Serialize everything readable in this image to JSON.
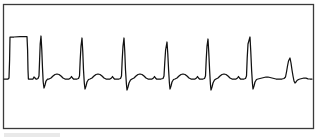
{
  "figure": {
    "kind": "ecg-rhythm-strip",
    "title": "",
    "caption": "",
    "background_color": "#ffffff",
    "frame": {
      "x": 3.5,
      "y": 4.5,
      "width": 310,
      "height": 124,
      "stroke_color": "#3a3a3a",
      "stroke_width": 1.3
    },
    "trace": {
      "stroke_color": "#111111",
      "stroke_width": 1.25
    },
    "artifact": {
      "x": 4,
      "y": 133,
      "width": 56,
      "height": 4,
      "color": "#e9e9e9"
    }
  },
  "chart_data": {
    "type": "line",
    "title": "",
    "xlabel": "",
    "ylabel": "",
    "grid": false,
    "legend": null,
    "xlim": [
      0,
      319
    ],
    "ylim": [
      128,
      4
    ],
    "baseline_y": 79,
    "annotations": [
      {
        "name": "calibration-pulse",
        "label": "calibration pulse",
        "x_start": 10,
        "x_end": 28,
        "top_y": 37,
        "baseline_y": 79
      }
    ],
    "beats": [
      {
        "index": 1,
        "r_peak_x": 41,
        "r_peak_y": 36,
        "s_trough_y": 88,
        "amplitude": "full"
      },
      {
        "index": 2,
        "r_peak_x": 82,
        "r_peak_y": 38,
        "s_trough_y": 89,
        "amplitude": "full"
      },
      {
        "index": 3,
        "r_peak_x": 124,
        "r_peak_y": 38,
        "s_trough_y": 90,
        "amplitude": "full"
      },
      {
        "index": 4,
        "r_peak_x": 167,
        "r_peak_y": 42,
        "s_trough_y": 89,
        "amplitude": "full"
      },
      {
        "index": 5,
        "r_peak_x": 208,
        "r_peak_y": 39,
        "s_trough_y": 90,
        "amplitude": "full"
      },
      {
        "index": 6,
        "r_peak_x": 250,
        "r_peak_y": 37,
        "s_trough_y": 89,
        "amplitude": "full"
      },
      {
        "index": 7,
        "r_peak_x": 290,
        "r_peak_y": 58,
        "s_trough_y": 83,
        "amplitude": "reduced"
      }
    ],
    "series": [
      {
        "name": "ecg-lead",
        "points": [
          [
            4,
            79
          ],
          [
            8,
            79
          ],
          [
            9,
            78
          ],
          [
            9.6,
            60
          ],
          [
            10,
            37
          ],
          [
            14,
            37
          ],
          [
            20,
            36.6
          ],
          [
            27,
            36.6
          ],
          [
            27.6,
            50
          ],
          [
            28,
            70
          ],
          [
            28.4,
            79
          ],
          [
            31,
            79
          ],
          [
            33,
            79
          ],
          [
            34,
            77
          ],
          [
            35,
            78
          ],
          [
            36,
            79
          ],
          [
            37,
            79
          ],
          [
            38,
            78.5
          ],
          [
            39,
            76
          ],
          [
            39.6,
            60
          ],
          [
            40.2,
            44
          ],
          [
            41,
            36
          ],
          [
            41.8,
            50
          ],
          [
            42.5,
            68
          ],
          [
            43.2,
            82
          ],
          [
            44,
            88
          ],
          [
            45,
            85
          ],
          [
            46,
            81
          ],
          [
            47.5,
            79
          ],
          [
            49,
            79
          ],
          [
            51,
            78
          ],
          [
            53,
            76
          ],
          [
            55,
            74.5
          ],
          [
            57,
            74
          ],
          [
            59,
            74.5
          ],
          [
            61,
            76
          ],
          [
            63,
            78
          ],
          [
            65,
            79
          ],
          [
            67,
            79
          ],
          [
            69,
            79
          ],
          [
            70.5,
            78
          ],
          [
            71.5,
            76.5
          ],
          [
            72.5,
            78
          ],
          [
            73.5,
            79
          ],
          [
            75,
            79
          ],
          [
            77,
            79
          ],
          [
            78.5,
            78.5
          ],
          [
            79.5,
            76
          ],
          [
            80.2,
            60
          ],
          [
            81,
            46
          ],
          [
            82,
            38
          ],
          [
            82.8,
            52
          ],
          [
            83.5,
            70
          ],
          [
            84.3,
            83
          ],
          [
            85,
            89
          ],
          [
            86,
            86
          ],
          [
            87,
            82
          ],
          [
            88.5,
            79.5
          ],
          [
            90,
            79
          ],
          [
            92,
            78
          ],
          [
            94,
            76
          ],
          [
            96,
            74.5
          ],
          [
            98,
            74
          ],
          [
            100,
            74.5
          ],
          [
            102,
            76
          ],
          [
            104,
            78
          ],
          [
            106,
            79
          ],
          [
            108,
            79
          ],
          [
            110,
            79
          ],
          [
            111.5,
            78
          ],
          [
            112.5,
            76.5
          ],
          [
            113.5,
            78
          ],
          [
            114.5,
            79
          ],
          [
            117,
            79
          ],
          [
            119,
            79
          ],
          [
            120.5,
            78.5
          ],
          [
            121.5,
            76
          ],
          [
            122.2,
            60
          ],
          [
            123,
            46
          ],
          [
            124,
            38
          ],
          [
            124.8,
            52
          ],
          [
            125.5,
            70
          ],
          [
            126.4,
            84
          ],
          [
            127,
            90
          ],
          [
            128,
            87
          ],
          [
            129,
            83
          ],
          [
            130.5,
            80
          ],
          [
            132,
            79
          ],
          [
            134,
            78
          ],
          [
            136,
            76
          ],
          [
            138,
            74.5
          ],
          [
            140,
            74
          ],
          [
            142,
            74.5
          ],
          [
            144,
            76
          ],
          [
            146,
            78
          ],
          [
            148,
            79
          ],
          [
            150,
            79
          ],
          [
            152,
            79
          ],
          [
            153.5,
            78
          ],
          [
            154.5,
            76.5
          ],
          [
            155.5,
            78
          ],
          [
            156.5,
            79
          ],
          [
            159,
            79
          ],
          [
            161,
            79
          ],
          [
            163,
            78.5
          ],
          [
            164,
            76
          ],
          [
            164.8,
            62
          ],
          [
            165.6,
            50
          ],
          [
            167,
            42
          ],
          [
            167.8,
            54
          ],
          [
            168.6,
            70
          ],
          [
            169.4,
            83
          ],
          [
            170,
            89
          ],
          [
            171,
            86
          ],
          [
            172,
            82
          ],
          [
            173.5,
            79.5
          ],
          [
            175,
            79
          ],
          [
            177,
            78
          ],
          [
            179,
            76
          ],
          [
            181,
            74.5
          ],
          [
            183,
            74
          ],
          [
            185,
            74.5
          ],
          [
            187,
            76
          ],
          [
            189,
            78
          ],
          [
            191,
            79
          ],
          [
            193,
            79
          ],
          [
            195,
            79
          ],
          [
            196.5,
            78
          ],
          [
            197.5,
            76.5
          ],
          [
            198.5,
            78
          ],
          [
            199.5,
            79
          ],
          [
            201,
            79
          ],
          [
            203,
            79
          ],
          [
            204.5,
            78.5
          ],
          [
            205.5,
            76
          ],
          [
            206.2,
            60
          ],
          [
            207,
            46
          ],
          [
            208,
            39
          ],
          [
            208.8,
            53
          ],
          [
            209.6,
            70
          ],
          [
            210.4,
            84
          ],
          [
            211,
            90
          ],
          [
            212,
            87
          ],
          [
            213,
            83
          ],
          [
            214.5,
            80
          ],
          [
            216,
            79
          ],
          [
            218,
            78
          ],
          [
            220,
            76
          ],
          [
            222,
            74.5
          ],
          [
            224,
            74
          ],
          [
            226,
            74.5
          ],
          [
            228,
            76
          ],
          [
            230,
            78
          ],
          [
            232,
            79
          ],
          [
            234,
            79
          ],
          [
            236,
            79
          ],
          [
            237.5,
            78
          ],
          [
            238.5,
            76.5
          ],
          [
            239.5,
            78
          ],
          [
            240.5,
            79
          ],
          [
            242,
            79
          ],
          [
            244,
            79
          ],
          [
            245.5,
            78.5
          ],
          [
            246.5,
            76
          ],
          [
            247.2,
            58
          ],
          [
            248,
            44
          ],
          [
            250,
            37
          ],
          [
            250.8,
            52
          ],
          [
            251.6,
            70
          ],
          [
            252.4,
            83
          ],
          [
            253,
            89
          ],
          [
            254,
            86
          ],
          [
            255,
            82
          ],
          [
            256.5,
            79.5
          ],
          [
            258,
            79
          ],
          [
            260,
            78.5
          ],
          [
            262,
            78
          ],
          [
            264,
            77.5
          ],
          [
            266,
            77
          ],
          [
            268,
            77
          ],
          [
            270,
            77.5
          ],
          [
            272,
            78
          ],
          [
            274,
            78.5
          ],
          [
            276,
            79
          ],
          [
            278,
            79
          ],
          [
            280,
            79
          ],
          [
            282,
            79
          ],
          [
            284,
            78.5
          ],
          [
            285.5,
            77
          ],
          [
            286.5,
            72
          ],
          [
            287.5,
            66
          ],
          [
            288.5,
            61
          ],
          [
            290,
            58
          ],
          [
            291,
            63
          ],
          [
            292,
            70
          ],
          [
            293,
            76
          ],
          [
            294,
            81
          ],
          [
            295,
            83
          ],
          [
            296,
            82
          ],
          [
            297,
            80.5
          ],
          [
            298.5,
            79.5
          ],
          [
            300,
            79
          ],
          [
            302,
            78.5
          ],
          [
            304,
            78
          ],
          [
            306,
            78.2
          ],
          [
            308,
            78.8
          ],
          [
            310,
            79
          ],
          [
            312,
            79
          ]
        ]
      }
    ]
  }
}
